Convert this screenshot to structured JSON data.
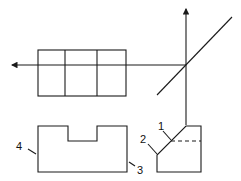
{
  "diagram": {
    "type": "orthographic-projection",
    "labels": [
      {
        "id": "1",
        "text": "1",
        "x": 158,
        "y": 121
      },
      {
        "id": "2",
        "text": "2",
        "x": 140,
        "y": 134
      },
      {
        "id": "3",
        "text": "3",
        "x": 137,
        "y": 165
      },
      {
        "id": "4",
        "text": "4",
        "x": 16,
        "y": 141
      }
    ],
    "stroke_color": "#1a1a1a"
  }
}
